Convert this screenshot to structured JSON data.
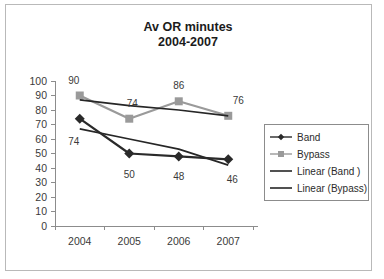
{
  "chart_data": {
    "type": "line",
    "title": "Av OR minutes",
    "subtitle": "2004-2007",
    "xlabel": "",
    "ylabel": "",
    "categories": [
      "2004",
      "2005",
      "2006",
      "2007"
    ],
    "ylim": [
      0,
      100
    ],
    "ytick_step": 10,
    "yticks": [
      "0",
      "10",
      "20",
      "30",
      "40",
      "50",
      "60",
      "70",
      "80",
      "90",
      "100"
    ],
    "grid": false,
    "legend_position": "right",
    "series": [
      {
        "name": "Band",
        "kind": "line-marker",
        "marker": "diamond",
        "color": "#2a2a2a",
        "values": [
          74,
          50,
          48,
          46
        ],
        "labels": [
          "74",
          "50",
          "48",
          "46"
        ]
      },
      {
        "name": "Bypass",
        "kind": "line-marker",
        "marker": "square",
        "color": "#9a9a9a",
        "values": [
          90,
          74,
          86,
          76
        ],
        "labels": [
          "90",
          "74",
          "86",
          "76"
        ]
      },
      {
        "name": "Linear (Band )",
        "kind": "trendline",
        "marker": "none",
        "color": "#262626",
        "values": [
          67,
          60,
          53,
          42
        ],
        "labels": []
      },
      {
        "name": "Linear (Bypass)",
        "kind": "trendline",
        "marker": "none",
        "color": "#262626",
        "values": [
          87,
          83,
          80,
          76
        ],
        "labels": []
      }
    ],
    "legend_entries": [
      {
        "label": "Band",
        "marker": "diamond",
        "color": "#2a2a2a"
      },
      {
        "label": "Bypass",
        "marker": "square",
        "color": "#9a9a9a"
      },
      {
        "label": "Linear (Band )",
        "marker": "none",
        "color": "#262626"
      },
      {
        "label": "Linear (Bypass)",
        "marker": "none",
        "color": "#262626"
      }
    ],
    "colors": {
      "band": "#2a2a2a",
      "bypass": "#9a9a9a",
      "trend": "#262626",
      "axis": "#8c8c8c",
      "text": "#2b2b2b",
      "frame": "#b9b9b9",
      "background": "#ffffff"
    }
  }
}
